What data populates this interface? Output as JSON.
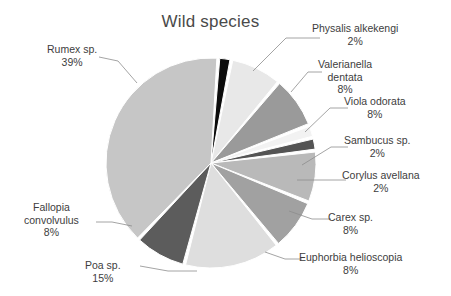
{
  "chart_data": {
    "type": "pie",
    "title": "Wild species",
    "xlabel": "",
    "ylabel": "",
    "legend_position": "none",
    "grid": false,
    "value_unit": "%",
    "labels": [
      "Physalis alkekengi",
      "Valerianella dentata",
      "Viola odorata",
      "Sambucus sp.",
      "Corylus avellana",
      "Carex sp.",
      "Euphorbia helioscopia",
      "Poa sp.",
      "Fallopia convolvulus",
      "Rumex sp."
    ],
    "values": [
      2,
      8,
      8,
      2,
      2,
      8,
      8,
      15,
      8,
      39
    ],
    "colors": [
      "#0c0c0c",
      "#e8e8e8",
      "#9a9a9a",
      "#f2f2f2",
      "#545454",
      "#b9b9b9",
      "#a1a1a1",
      "#dedede",
      "#5c5c5c",
      "#c6c6c6"
    ],
    "slices": [
      {
        "name": "Physalis alkekengi",
        "value": 2,
        "pct_label": "2%",
        "color": "#0c0c0c"
      },
      {
        "name": "Valerianella dentata",
        "value": 8,
        "pct_label": "8%",
        "color": "#e8e8e8"
      },
      {
        "name": "Viola odorata",
        "value": 8,
        "pct_label": "8%",
        "color": "#9a9a9a"
      },
      {
        "name": "Sambucus sp.",
        "value": 2,
        "pct_label": "2%",
        "color": "#f2f2f2"
      },
      {
        "name": "Corylus avellana",
        "value": 2,
        "pct_label": "2%",
        "color": "#545454"
      },
      {
        "name": "Carex sp.",
        "value": 8,
        "pct_label": "8%",
        "color": "#b9b9b9"
      },
      {
        "name": "Euphorbia helioscopia",
        "value": 8,
        "pct_label": "8%",
        "color": "#a1a1a1"
      },
      {
        "name": "Poa sp.",
        "value": 15,
        "pct_label": "15%",
        "color": "#dedede"
      },
      {
        "name": "Fallopia convolvulus",
        "value": 8,
        "pct_label": "8%",
        "color": "#5c5c5c"
      },
      {
        "name": "Rumex sp.",
        "value": 39,
        "pct_label": "39%",
        "color": "#c6c6c6"
      }
    ]
  },
  "labels": {
    "physalis": {
      "name": "Physalis alkekengi",
      "pct": "2%"
    },
    "valerianella": {
      "name": "Valerianella",
      "name2": "dentata",
      "pct": "8%"
    },
    "viola": {
      "name": "Viola odorata",
      "pct": "8%"
    },
    "sambucus": {
      "name": "Sambucus sp.",
      "pct": "2%"
    },
    "corylus": {
      "name": "Corylus avellana",
      "pct": "2%"
    },
    "carex": {
      "name": "Carex sp.",
      "pct": "8%"
    },
    "euphorbia": {
      "name": "Euphorbia helioscopia",
      "pct": "8%"
    },
    "poa": {
      "name": "Poa sp.",
      "pct": "15%"
    },
    "fallopia": {
      "name": "Fallopia",
      "name2": "convolvulus",
      "pct": "8%"
    },
    "rumex": {
      "name": "Rumex sp.",
      "pct": "39%"
    }
  }
}
